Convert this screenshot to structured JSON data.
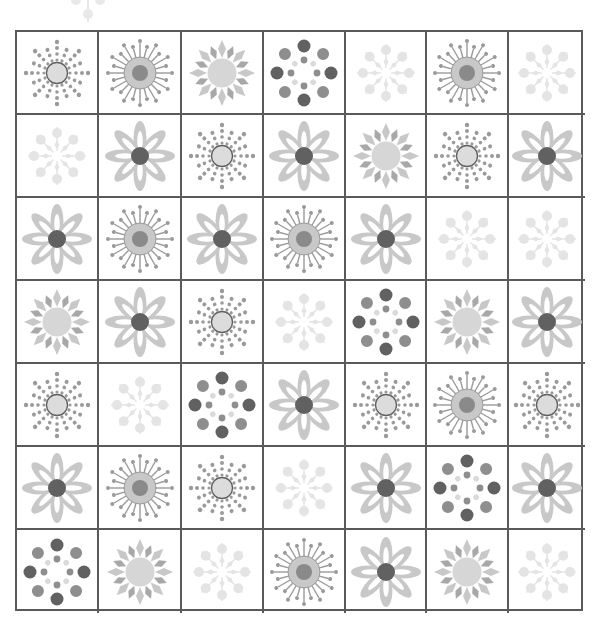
{
  "puzzle": {
    "rows": 7,
    "cols": 7,
    "icon_types": {
      "dotsun": "dotted-sun-icon",
      "spiky": "spiky-virus-sun-icon",
      "diamond": "diamond-ray-sun-icon",
      "dotring": "dot-ring-icon",
      "snow": "faint-snowflake-icon",
      "flower": "daisy-flower-icon"
    },
    "grid": [
      [
        "dotsun",
        "spiky",
        "diamond",
        "dotring",
        "snow",
        "spiky",
        "snow"
      ],
      [
        "snow",
        "flower",
        "dotsun",
        "flower",
        "diamond",
        "dotsun",
        "flower"
      ],
      [
        "flower",
        "spiky",
        "flower",
        "spiky",
        "flower",
        "snow",
        "snow"
      ],
      [
        "diamond",
        "flower",
        "dotsun",
        "snow",
        "dotring",
        "diamond",
        "flower"
      ],
      [
        "dotsun",
        "snow",
        "dotring",
        "flower",
        "dotsun",
        "spiky",
        "dotsun"
      ],
      [
        "flower",
        "spiky",
        "dotsun",
        "snow",
        "flower",
        "dotring",
        "flower"
      ],
      [
        "dotring",
        "diamond",
        "snow",
        "spiky",
        "flower",
        "diamond",
        "snow"
      ]
    ]
  },
  "colors": {
    "grid_line": "#5a5a5a",
    "light_gray": "#c8c8c8",
    "mid_gray": "#9a9a9a",
    "dark_gray": "#616161",
    "faint": "#e4e4e4"
  }
}
